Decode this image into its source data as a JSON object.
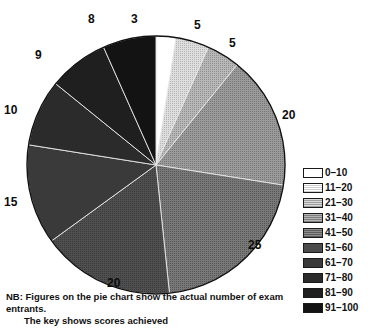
{
  "chart_data": {
    "type": "pie",
    "title": "",
    "subtitle": "",
    "xlabel": "",
    "ylabel": "",
    "total": 120,
    "units": "exam entrants",
    "start_angle_deg": 0,
    "direction": "clockwise",
    "legend_position": "right",
    "grid": false,
    "categories": [
      "0–10",
      "11–20",
      "21–30",
      "31–40",
      "41–50",
      "51–60",
      "61–70",
      "71–80",
      "81–90",
      "91–100"
    ],
    "values": [
      3,
      5,
      5,
      20,
      25,
      20,
      15,
      10,
      9,
      8
    ],
    "slice_labels": [
      "3",
      "5",
      "5",
      "20",
      "25",
      "20",
      "15",
      "10",
      "9",
      "8"
    ],
    "colors": [
      "#ffffff",
      "#c9c9c9",
      "#a8a8a8",
      "#8e8e8e",
      "#6f6f6f",
      "#4b4b4b",
      "#3a3a3a",
      "#2b2b2b",
      "#1f1f1f",
      "#131313"
    ],
    "annotations": [
      "NB: Figures on the pie chart show the actual number of exam entrants.",
      "The key shows scores achieved"
    ]
  },
  "legend": {
    "entries": [
      {
        "label": "0–10",
        "color": "#ffffff"
      },
      {
        "label": "11–20",
        "color": "#c9c9c9"
      },
      {
        "label": "21–30",
        "color": "#a8a8a8"
      },
      {
        "label": "31–40",
        "color": "#8e8e8e"
      },
      {
        "label": "41–50",
        "color": "#6f6f6f"
      },
      {
        "label": "51–60",
        "color": "#4b4b4b"
      },
      {
        "label": "61–70",
        "color": "#3a3a3a"
      },
      {
        "label": "71–80",
        "color": "#2b2b2b"
      },
      {
        "label": "81–90",
        "color": "#1f1f1f"
      },
      {
        "label": "91–100",
        "color": "#131313"
      }
    ]
  },
  "caption": {
    "line1": "NB: Figures on the pie chart show the actual number of exam entrants.",
    "line2": "The key shows scores achieved"
  }
}
